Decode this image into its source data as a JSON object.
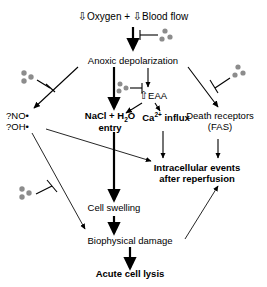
{
  "diagram": {
    "title_row": {
      "oxygen_arrow": "⇩",
      "oxygen_label": "Oxygen",
      "plus": "+",
      "blood_arrow": "⇩",
      "blood_label": "Blood flow"
    },
    "nodes": [
      {
        "id": "anoxic",
        "label": "Anoxic depolarization",
        "style": "regular"
      },
      {
        "id": "eaa",
        "label": "EAA",
        "prefix_arrow": "⇧",
        "style": "regular"
      },
      {
        "id": "nacl_l1",
        "label": "NaCl + H O",
        "style": "bold"
      },
      {
        "id": "nacl_l2",
        "label": "entry",
        "style": "bold"
      },
      {
        "id": "ca_influx",
        "label": "Ca   influx",
        "style": "bold"
      },
      {
        "id": "death_l1",
        "label": "Death receptors",
        "style": "regular"
      },
      {
        "id": "death_l2",
        "label": "(FAS)",
        "style": "regular"
      },
      {
        "id": "radical_1",
        "label": "?NO•",
        "style": "regular"
      },
      {
        "id": "radical_2",
        "label": "?OH•",
        "style": "regular"
      },
      {
        "id": "intra_l1",
        "label": "Intracellular events",
        "style": "bold"
      },
      {
        "id": "intra_l2",
        "label": "after reperfusion",
        "style": "bold"
      },
      {
        "id": "cell_swelling",
        "label": "Cell swelling",
        "style": "regular"
      },
      {
        "id": "biophysical",
        "label": "Biophysical damage",
        "style": "regular"
      },
      {
        "id": "lysis",
        "label": "Acute cell lysis",
        "style": "bold"
      }
    ],
    "subscripts": {
      "water": "2",
      "calcium": "2+"
    },
    "icons": {
      "down_arrow": "⇩",
      "up_arrow": "⇧",
      "radical_dot": "•"
    },
    "molecule_clusters": [
      {
        "id": "cluster-top",
        "x": 167,
        "y": 36,
        "note": "inhibits anoxic depolarization pathway"
      },
      {
        "id": "cluster-left-upper",
        "x": 28,
        "y": 76,
        "note": "inhibits left branch to radicals"
      },
      {
        "id": "cluster-middle",
        "x": 123,
        "y": 88,
        "note": "inhibits EAA release arrow"
      },
      {
        "id": "cluster-right",
        "x": 237,
        "y": 72,
        "note": "inhibits right branch to death receptors"
      },
      {
        "id": "cluster-left-lower",
        "x": 26,
        "y": 193,
        "note": "inhibits radical path to biophysical damage"
      }
    ],
    "colors": {
      "background": "#ffffff",
      "text": "#000000",
      "line": "#000000",
      "molecule": "#8c8c8c"
    }
  }
}
